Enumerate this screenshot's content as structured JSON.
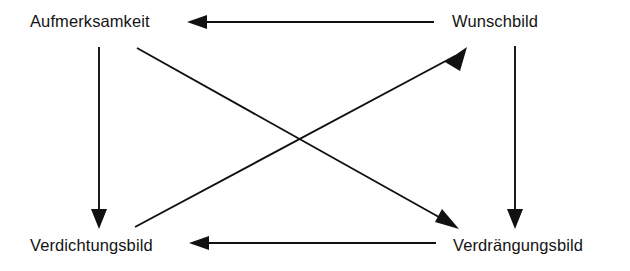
{
  "diagram": {
    "background_color": "#ffffff",
    "line_color": "#111111",
    "nodes": [
      {
        "id": "aufmerksamkeit",
        "label": "Aufmerksamkeit",
        "position": "top-left"
      },
      {
        "id": "wunschbild",
        "label": "Wunschbild",
        "position": "top-right"
      },
      {
        "id": "verdichtungsbild",
        "label": "Verdichtungsbild",
        "position": "bottom-left"
      },
      {
        "id": "verdraengungsbild",
        "label": "Verdrängungsbild",
        "position": "bottom-right"
      }
    ],
    "edges": [
      {
        "id": "wunschbild-to-aufmerksamkeit",
        "from": "wunschbild",
        "to": "aufmerksamkeit",
        "style": "horizontal-top",
        "arrow": "left"
      },
      {
        "id": "aufmerksamkeit-to-verdichtungsbild",
        "from": "aufmerksamkeit",
        "to": "verdichtungsbild",
        "style": "vertical-left",
        "arrow": "down"
      },
      {
        "id": "wunschbild-to-verdraengungsbild",
        "from": "wunschbild",
        "to": "verdraengungsbild",
        "style": "vertical-right",
        "arrow": "down"
      },
      {
        "id": "verdraengungsbild-to-verdichtungsbild",
        "from": "verdraengungsbild",
        "to": "verdichtungsbild",
        "style": "horizontal-bottom",
        "arrow": "left"
      },
      {
        "id": "aufmerksamkeit-to-verdraengungsbild",
        "from": "aufmerksamkeit",
        "to": "verdraengungsbild",
        "style": "diagonal-down-right",
        "arrow": "down-right"
      },
      {
        "id": "verdichtungsbild-to-wunschbild",
        "from": "verdichtungsbild",
        "to": "wunschbild",
        "style": "diagonal-up-right",
        "arrow": "up-right"
      }
    ]
  }
}
